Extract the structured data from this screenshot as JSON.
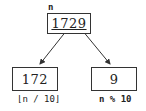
{
  "diagram": {
    "root": {
      "label": "n",
      "value": "1729"
    },
    "children": [
      {
        "value": "172",
        "label": "⌊n / 10⌋"
      },
      {
        "value": "9",
        "label": "n % 10"
      }
    ],
    "colors": {
      "stroke": "#333333",
      "text": "#222222"
    }
  }
}
